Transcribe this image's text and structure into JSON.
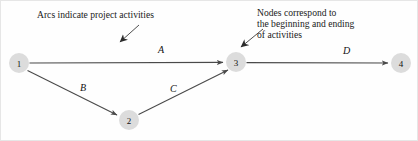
{
  "figure": {
    "type": "activity-on-arc network diagram",
    "background_color": "#fefefe",
    "border_color": "#e6e6e6",
    "node_fill_color": "#dcdcdc",
    "line_color": "#4a4a4a",
    "text_color": "#1a1a1a"
  },
  "annotations": {
    "arcs_note": "Arcs indicate project activities",
    "nodes_note_line1": "Nodes correspond to",
    "nodes_note_line2": "the beginning and ending",
    "nodes_note_line3": "of activities"
  },
  "nodes": [
    {
      "id": "1",
      "label": "1",
      "cx": 18,
      "cy": 62,
      "r": 10
    },
    {
      "id": "2",
      "label": "2",
      "cx": 128,
      "cy": 119,
      "r": 10
    },
    {
      "id": "3",
      "label": "3",
      "cx": 235,
      "cy": 61,
      "r": 10
    },
    {
      "id": "4",
      "label": "4",
      "cx": 400,
      "cy": 62,
      "r": 10
    }
  ],
  "arcs": [
    {
      "id": "A",
      "label": "A",
      "from": "1",
      "to": "3"
    },
    {
      "id": "B",
      "label": "B",
      "from": "1",
      "to": "2"
    },
    {
      "id": "C",
      "label": "C",
      "from": "2",
      "to": "3"
    },
    {
      "id": "D",
      "label": "D",
      "from": "3",
      "to": "4"
    }
  ]
}
